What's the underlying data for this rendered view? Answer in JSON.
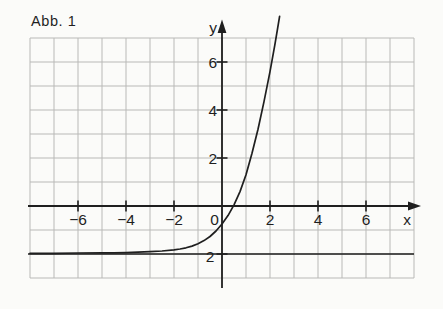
{
  "figure_label": "Abb. 1",
  "colors": {
    "ink": "#1f1f1f",
    "grid_line": "#b9b9b7",
    "background": "#fbfbf9"
  },
  "chart_data": {
    "type": "line",
    "title": "Abb. 1",
    "xlabel": "x",
    "ylabel": "y",
    "xlim": [
      -8,
      8
    ],
    "ylim": [
      -3,
      7
    ],
    "grid": true,
    "grid_step": 1,
    "origin_label": "0",
    "x_ticks": [
      {
        "value": -6,
        "label": "−6"
      },
      {
        "value": -4,
        "label": "−4"
      },
      {
        "value": -2,
        "label": "−2"
      },
      {
        "value": 2,
        "label": "2"
      },
      {
        "value": 4,
        "label": "4"
      },
      {
        "value": 6,
        "label": "6"
      }
    ],
    "y_ticks": [
      {
        "value": 2,
        "label": "2"
      },
      {
        "value": 4,
        "label": "4"
      },
      {
        "value": 6,
        "label": "6"
      },
      {
        "value": -2,
        "label": "2"
      }
    ],
    "asymptote": {
      "y": -2,
      "style": "solid"
    },
    "series": [
      {
        "name": "exponential-curve",
        "points": [
          [
            -8,
            -1.97
          ],
          [
            -7,
            -1.97
          ],
          [
            -6,
            -1.96
          ],
          [
            -5,
            -1.955
          ],
          [
            -4.5,
            -1.95
          ],
          [
            -4,
            -1.94
          ],
          [
            -3.5,
            -1.925
          ],
          [
            -3,
            -1.905
          ],
          [
            -2.5,
            -1.875
          ],
          [
            -2,
            -1.83
          ],
          [
            -1.75,
            -1.79
          ],
          [
            -1.5,
            -1.74
          ],
          [
            -1.25,
            -1.67
          ],
          [
            -1,
            -1.57
          ],
          [
            -0.75,
            -1.44
          ],
          [
            -0.5,
            -1.27
          ],
          [
            -0.25,
            -1.04
          ],
          [
            0,
            -0.75
          ],
          [
            0.25,
            -0.4
          ],
          [
            0.5,
            0.05
          ],
          [
            0.75,
            0.6
          ],
          [
            1,
            1.3
          ],
          [
            1.25,
            2.2
          ],
          [
            1.5,
            3.2
          ],
          [
            1.75,
            4.35
          ],
          [
            2,
            5.6
          ],
          [
            2.2,
            6.7
          ],
          [
            2.3,
            7.3
          ],
          [
            2.4,
            7.9
          ]
        ]
      }
    ]
  }
}
